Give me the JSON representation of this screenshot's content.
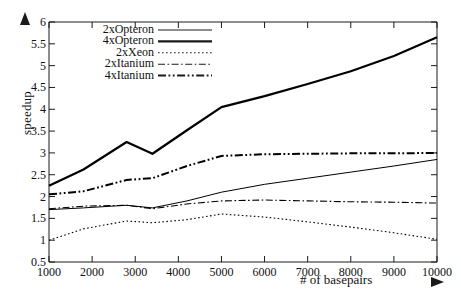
{
  "chart_data": {
    "type": "line",
    "title": "",
    "xlabel": "# of basepairs",
    "ylabel": "speedup",
    "xlim": [
      1000,
      10000
    ],
    "ylim": [
      0.5,
      6
    ],
    "xticks": [
      "1000",
      "2000",
      "3000",
      "4000",
      "5000",
      "6000",
      "7000",
      "8000",
      "9000",
      "10000"
    ],
    "yticks": [
      "0.5",
      "1",
      "1.5",
      "2",
      "2.5",
      "3",
      "3.5",
      "4",
      "4.5",
      "5",
      "5.5",
      "6"
    ],
    "grid": false,
    "legend_position": "top-left",
    "x": [
      1000,
      1800,
      2800,
      3400,
      4200,
      5000,
      6000,
      7000,
      8000,
      9000,
      10000
    ],
    "series": [
      {
        "name": "2xOpteron",
        "style": "solid-thin",
        "color": "#000000",
        "values": [
          1.7,
          1.74,
          1.8,
          1.74,
          1.9,
          2.1,
          2.28,
          2.42,
          2.56,
          2.7,
          2.85
        ]
      },
      {
        "name": "4xOpteron",
        "style": "solid-thick",
        "color": "#000000",
        "values": [
          2.25,
          2.62,
          3.25,
          2.98,
          3.52,
          4.05,
          4.3,
          4.58,
          4.87,
          5.22,
          5.65
        ]
      },
      {
        "name": "2xXeon",
        "style": "dotted",
        "color": "#000000",
        "values": [
          1.0,
          1.26,
          1.44,
          1.4,
          1.47,
          1.6,
          1.53,
          1.42,
          1.3,
          1.17,
          1.02
        ]
      },
      {
        "name": "2xItanium",
        "style": "dash-dot",
        "color": "#000000",
        "values": [
          1.72,
          1.78,
          1.8,
          1.72,
          1.83,
          1.9,
          1.92,
          1.9,
          1.88,
          1.87,
          1.85
        ]
      },
      {
        "name": "4xItanium",
        "style": "dash-dot-dot-thick",
        "color": "#000000",
        "values": [
          2.05,
          2.12,
          2.38,
          2.42,
          2.7,
          2.93,
          2.97,
          2.98,
          2.99,
          2.99,
          3.0
        ]
      }
    ]
  },
  "axis": {
    "y_arrow": "up-arrow",
    "x_arrow": "right-arrow"
  }
}
